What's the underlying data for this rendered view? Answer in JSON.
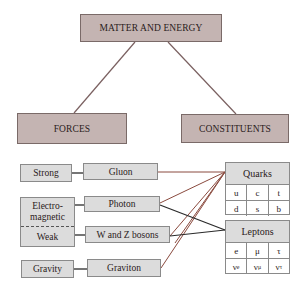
{
  "root": {
    "label": "MATTER AND ENERGY"
  },
  "branches": {
    "forces": "FORCES",
    "constituents": "CONSTITUENTS"
  },
  "forces": [
    {
      "force": "Strong",
      "carrier": "Gluon"
    },
    {
      "force": "Electro-magnetic",
      "force_line1": "Electro-",
      "force_line2": "magnetic",
      "carrier": "Photon"
    },
    {
      "force": "Weak",
      "carrier": "W and Z bosons"
    },
    {
      "force": "Gravity",
      "carrier": "Graviton"
    }
  ],
  "quarks": {
    "title": "Quarks",
    "rows": [
      [
        "u",
        "c",
        "t"
      ],
      [
        "d",
        "s",
        "b"
      ]
    ]
  },
  "leptons": {
    "title": "Leptons",
    "rows": [
      [
        "e",
        "μ",
        "τ"
      ],
      [
        "ν",
        "ν",
        "ν"
      ]
    ],
    "subscripts": [
      "e",
      "μ",
      "τ"
    ]
  },
  "colors": {
    "top_box_fill": "#c4b4b2",
    "box_fill": "#dcdcdc",
    "quark_line": "#8a4a3e",
    "lepton_line": "#2a2a2a",
    "tree_line": "#7a6060"
  },
  "connections": [
    {
      "from": "Gluon",
      "to": "Quarks"
    },
    {
      "from": "Photon",
      "to": "Quarks"
    },
    {
      "from": "Photon",
      "to": "Leptons"
    },
    {
      "from": "W and Z bosons",
      "to": "Quarks"
    },
    {
      "from": "W and Z bosons",
      "to": "Leptons"
    },
    {
      "from": "Graviton",
      "to": "Quarks"
    }
  ]
}
